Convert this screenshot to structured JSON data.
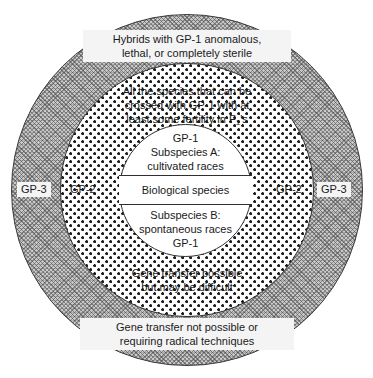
{
  "diagram": {
    "type": "concentric-circles",
    "rings": [
      {
        "id": "gp3",
        "label": "GP-3",
        "fill": "hatched-grey",
        "caption_top": {
          "line1": "Hybrids with GP-1 anomalous,",
          "line2": "lethal, or completely sterile"
        },
        "caption_bottom": {
          "line1": "Gene transfer not possible or",
          "line2": "requiring radical techniques"
        }
      },
      {
        "id": "gp2",
        "label": "GP-2",
        "fill": "dotted-stipple",
        "caption_top": {
          "line1": "All the species that can be",
          "line2": "crossed with GP-1 with at",
          "line3_a": "least some fertility in F",
          "line3_sub": "1",
          "line3_b": "'s"
        },
        "caption_bottom": {
          "line1": "Gene transfer possible",
          "line2": "but may be difficult"
        }
      },
      {
        "id": "gp1",
        "label": "GP-1",
        "fill": "white",
        "core_top": {
          "line1": "GP-1",
          "line2": "Subspecies A:",
          "line3": "cultivated races"
        },
        "core_band": "Biological species",
        "core_bottom": {
          "line1": "Subspecies B:",
          "line2": "spontaneous races",
          "line3": "GP-1"
        }
      }
    ],
    "ring_labels": {
      "gp3_left": "GP-3",
      "gp3_right": "GP-3",
      "gp2_left": "GP-2",
      "gp2_right": "GP-2"
    },
    "colors": {
      "outer_ring_fill": "#c9c9c9",
      "stroke": "#2f2f2f",
      "text": "#1a1a1a",
      "label_background": "#f4f4f4",
      "core_fill": "#ffffff"
    }
  }
}
